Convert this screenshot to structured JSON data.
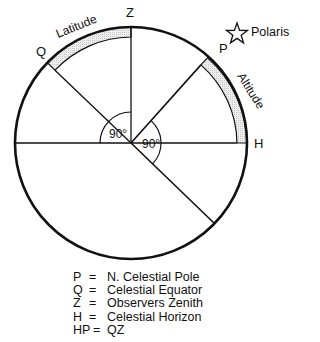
{
  "diagram": {
    "labels": {
      "z": "Z",
      "q": "Q",
      "p": "P",
      "h": "H",
      "polaris": "Polaris",
      "latitude": "Latitude",
      "altitude": "Altitude",
      "angle_left": "90°",
      "angle_right": "90°"
    },
    "colors": {
      "stroke": "#111111",
      "arc_fill": "#e4e4e4"
    }
  },
  "legend": {
    "items": [
      {
        "key": "P",
        "eq": "=",
        "value": "N. Celestial Pole"
      },
      {
        "key": "Q",
        "eq": "=",
        "value": "Celestial Equator"
      },
      {
        "key": "Z",
        "eq": "=",
        "value": "Observers Zenith"
      },
      {
        "key": "H",
        "eq": "=",
        "value": "Celestial Horizon"
      },
      {
        "key": "HP",
        "eq": "=",
        "value": "QZ"
      }
    ]
  }
}
